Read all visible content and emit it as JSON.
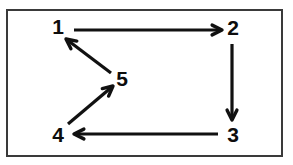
{
  "figure": {
    "background_color": "#ffffff",
    "frame_color": "#3a3a3a",
    "stroke_color": "#111111",
    "label_color": "#0d0d0d"
  },
  "nodes": [
    {
      "id": "1",
      "label": "1",
      "x": 58,
      "y": 26
    },
    {
      "id": "2",
      "label": "2",
      "x": 233,
      "y": 27
    },
    {
      "id": "3",
      "label": "3",
      "x": 233,
      "y": 134
    },
    {
      "id": "4",
      "label": "4",
      "x": 58,
      "y": 134
    },
    {
      "id": "5",
      "label": "5",
      "x": 122,
      "y": 78
    }
  ],
  "edges": [
    {
      "id": "e1",
      "from": "1",
      "to": "2",
      "direction": "right",
      "x1": 74,
      "y1": 30,
      "x2": 222,
      "y2": 30
    },
    {
      "id": "e2",
      "from": "2",
      "to": "3",
      "direction": "down",
      "x1": 232,
      "y1": 44,
      "x2": 232,
      "y2": 120
    },
    {
      "id": "e3",
      "from": "3",
      "to": "4",
      "direction": "left",
      "x1": 218,
      "y1": 134,
      "x2": 74,
      "y2": 134
    },
    {
      "id": "e4",
      "from": "4",
      "to": "5",
      "direction": "up-right",
      "x1": 68,
      "y1": 124,
      "x2": 113,
      "y2": 86
    },
    {
      "id": "e5",
      "from": "5",
      "to": "1",
      "direction": "up-left",
      "x1": 111,
      "y1": 73,
      "x2": 66,
      "y2": 39
    }
  ],
  "arrowheads": {
    "style": "open-v",
    "size_px": 11
  }
}
